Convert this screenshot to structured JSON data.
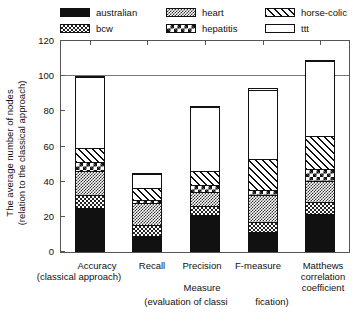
{
  "chart_data": {
    "type": "bar",
    "stacked": true,
    "title": "",
    "xlabel": "Measure (evaluation of classification)",
    "ylabel": "The average number of nodes (relation to the classical approach)",
    "ylim": [
      0,
      120
    ],
    "yticks": [
      0,
      20,
      40,
      60,
      80,
      100,
      120
    ],
    "grid": false,
    "reference_line": 100,
    "legend_position": "top",
    "categories": [
      "Accuracy",
      "Recall",
      "Precision",
      "F-measure",
      "Matthews correlation coefficient"
    ],
    "series": [
      {
        "name": "australian",
        "values": [
          25,
          8.5,
          21,
          11,
          21
        ]
      },
      {
        "name": "bcw",
        "values": [
          7,
          6.5,
          5,
          6,
          7
        ]
      },
      {
        "name": "heart",
        "values": [
          14,
          13,
          8,
          15,
          12.5
        ]
      },
      {
        "name": "hepatitis",
        "values": [
          5,
          2,
          4,
          3,
          6.5
        ]
      },
      {
        "name": "horse-colic",
        "values": [
          8,
          7,
          8,
          18,
          19
        ]
      },
      {
        "name": "ttt",
        "values": [
          41,
          8,
          37,
          40,
          43
        ]
      }
    ],
    "totals": [
      100,
      45,
      83,
      93,
      109
    ]
  },
  "legend": {
    "entries": [
      {
        "label": "australian",
        "pattern": "solid-black",
        "col": 0,
        "row": 0
      },
      {
        "label": "bcw",
        "pattern": "fine-checker",
        "col": 0,
        "row": 1
      },
      {
        "label": "heart",
        "pattern": "dense-checker",
        "col": 1,
        "row": 0
      },
      {
        "label": "hepatitis",
        "pattern": "coarse-checker",
        "col": 1,
        "row": 1
      },
      {
        "label": "horse-colic",
        "pattern": "diagonal-hatch",
        "col": 2,
        "row": 0
      },
      {
        "label": "ttt",
        "pattern": "empty-white",
        "col": 2,
        "row": 1
      }
    ]
  },
  "yaxis": {
    "title_line1": "The average number of nodes",
    "title_line2": "(relation to the classical approach)",
    "ticks": [
      "120",
      "100",
      "80",
      "60",
      "40",
      "20",
      "0"
    ]
  },
  "xaxis": {
    "tick_labels": [
      {
        "line1": "Accuracy",
        "line2": "(classical approach)",
        "line3": "",
        "line4": ""
      },
      {
        "line1": "Recall",
        "line2": "",
        "line3": "",
        "line4": ""
      },
      {
        "line1": "Precision",
        "line2": "",
        "line3": "Measure",
        "line4": "(evaluation of classi"
      },
      {
        "line1": "F-measure",
        "line2": "",
        "line3": "",
        "line4": "fication)"
      },
      {
        "line1": "Matthews",
        "line2": "correlation",
        "line3": "coefficient",
        "line4": ""
      }
    ],
    "axis_title_part1": "Measure",
    "axis_title_part2": "(evaluation of classi",
    "axis_title_part3": "fication)"
  },
  "colors": {
    "ink": "#111111",
    "frame": "#555555",
    "refline": "#777777",
    "background": "#ffffff"
  }
}
